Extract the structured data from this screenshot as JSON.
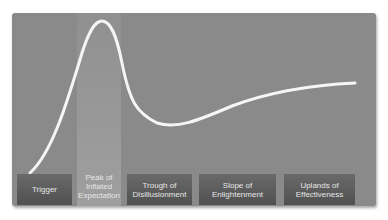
{
  "diagram": {
    "colors": {
      "panel": "#8a8a8a",
      "curve": "#f5f5f5",
      "label_bg": "#5a5a5a",
      "label_text": "#e6e6e6"
    },
    "phases": [
      {
        "label_line1": "Trigger",
        "label_line2": "",
        "label_line3": ""
      },
      {
        "label_line1": "Peak of",
        "label_line2": "Inflated",
        "label_line3": "Expectation"
      },
      {
        "label_line1": "Trough of",
        "label_line2": "Disillusionment",
        "label_line3": ""
      },
      {
        "label_line1": "Slope of",
        "label_line2": "Enlightenment",
        "label_line3": ""
      },
      {
        "label_line1": "Uplands of",
        "label_line2": "Effectiveness",
        "label_line3": ""
      }
    ]
  }
}
